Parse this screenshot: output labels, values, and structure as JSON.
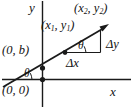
{
  "figure": {
    "background_color": "#ffffff",
    "ink_color": "#1a1a1a",
    "axes": {
      "x_label": "x",
      "y_label": "y",
      "origin_label": "(0, 0)",
      "x_axis_y_px": 79,
      "y_axis_x_px": 42
    },
    "labels": {
      "point1": "(x₁, y₁)",
      "point1_parts": {
        "open": "(x",
        "sub1": "1",
        "mid": ", y",
        "sub2": "1",
        "close": ")"
      },
      "point2": "(x₂, y₂)",
      "point2_parts": {
        "open": "(x",
        "sub1": "2",
        "mid": ", y",
        "sub2": "2",
        "close": ")"
      },
      "y_intercept": "(0, b)",
      "origin": "(0, 0)",
      "delta_y": "Δy",
      "delta_x": "Δx",
      "theta_upper": "θ",
      "theta_lower": "θ"
    },
    "geometry": {
      "line_start_px": [
        4,
        87
      ],
      "line_end_px": [
        108,
        25
      ],
      "point1_px": [
        65,
        52
      ],
      "point2_px": [
        104,
        28
      ],
      "y_intercept_px": [
        42,
        68
      ],
      "x_intercept_px": [
        13,
        79
      ],
      "triangle_corner_px": [
        100,
        52
      ]
    }
  }
}
